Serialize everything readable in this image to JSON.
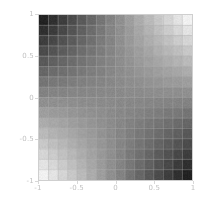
{
  "figure": {
    "type": "density-plot",
    "background_color": "#ffffff",
    "frame_color": "#cfcfcf",
    "grid_color": "#b0b0b0",
    "tick_label_color": "#c2c2c2"
  },
  "chart_data": {
    "type": "heatmap",
    "title": "",
    "subtitle": "",
    "xlabel": "",
    "ylabel": "",
    "xlim": [
      -1,
      1
    ],
    "ylim": [
      -1,
      1
    ],
    "xticks": [
      -1,
      -0.5,
      0,
      0.5,
      1
    ],
    "yticks": [
      -1,
      -0.5,
      0,
      0.5,
      1
    ],
    "xtick_labels": [
      "-1",
      "-0.5",
      "0",
      "0.5",
      "1"
    ],
    "ytick_labels": [
      "-1",
      "-0.5",
      "0",
      "0.5",
      "1"
    ],
    "grid": true,
    "legend": "none",
    "colormap": "grayscale",
    "colormap_min_color": "#141414",
    "colormap_max_color": "#ffffff",
    "nx": 16,
    "ny": 16,
    "value_range": [
      -1,
      1
    ],
    "values": [
      [
        -0.879,
        -0.762,
        -0.645,
        -0.527,
        -0.41,
        -0.293,
        -0.176,
        -0.059,
        0.059,
        0.176,
        0.293,
        0.41,
        0.527,
        0.645,
        0.762,
        0.879
      ],
      [
        -0.762,
        -0.66,
        -0.559,
        -0.457,
        -0.355,
        -0.254,
        -0.152,
        -0.051,
        0.051,
        0.152,
        0.254,
        0.355,
        0.457,
        0.559,
        0.66,
        0.762
      ],
      [
        -0.645,
        -0.559,
        -0.473,
        -0.387,
        -0.301,
        -0.215,
        -0.129,
        -0.043,
        0.043,
        0.129,
        0.215,
        0.301,
        0.387,
        0.473,
        0.559,
        0.645
      ],
      [
        -0.527,
        -0.457,
        -0.387,
        -0.316,
        -0.246,
        -0.176,
        -0.105,
        -0.035,
        0.035,
        0.105,
        0.176,
        0.246,
        0.316,
        0.387,
        0.457,
        0.527
      ],
      [
        -0.41,
        -0.355,
        -0.301,
        -0.246,
        -0.191,
        -0.137,
        -0.082,
        -0.027,
        0.027,
        0.082,
        0.137,
        0.191,
        0.246,
        0.301,
        0.355,
        0.41
      ],
      [
        -0.293,
        -0.254,
        -0.215,
        -0.176,
        -0.137,
        -0.098,
        -0.059,
        -0.02,
        0.02,
        0.059,
        0.098,
        0.137,
        0.176,
        0.215,
        0.254,
        0.293
      ],
      [
        -0.176,
        -0.152,
        -0.129,
        -0.105,
        -0.082,
        -0.059,
        -0.035,
        -0.012,
        0.012,
        0.035,
        0.059,
        0.082,
        0.105,
        0.129,
        0.152,
        0.176
      ],
      [
        -0.059,
        -0.051,
        -0.043,
        -0.035,
        -0.027,
        -0.02,
        -0.012,
        -0.004,
        0.004,
        0.012,
        0.02,
        0.027,
        0.035,
        0.043,
        0.051,
        0.059
      ],
      [
        0.059,
        0.051,
        0.043,
        0.035,
        0.027,
        0.02,
        0.012,
        0.004,
        -0.004,
        -0.012,
        -0.02,
        -0.027,
        -0.035,
        -0.043,
        -0.051,
        -0.059
      ],
      [
        0.176,
        0.152,
        0.129,
        0.105,
        0.082,
        0.059,
        0.035,
        0.012,
        -0.012,
        -0.035,
        -0.059,
        -0.082,
        -0.105,
        -0.129,
        -0.152,
        -0.176
      ],
      [
        0.293,
        0.254,
        0.215,
        0.176,
        0.137,
        0.098,
        0.059,
        0.02,
        -0.02,
        -0.059,
        -0.098,
        -0.137,
        -0.176,
        -0.215,
        -0.254,
        -0.293
      ],
      [
        0.41,
        0.355,
        0.301,
        0.246,
        0.191,
        0.137,
        0.082,
        0.027,
        -0.027,
        -0.082,
        -0.137,
        -0.191,
        -0.246,
        -0.301,
        -0.355,
        -0.41
      ],
      [
        0.527,
        0.457,
        0.387,
        0.316,
        0.246,
        0.176,
        0.105,
        0.035,
        -0.035,
        -0.105,
        -0.176,
        -0.246,
        -0.316,
        -0.387,
        -0.457,
        -0.527
      ],
      [
        0.645,
        0.559,
        0.473,
        0.387,
        0.301,
        0.215,
        0.129,
        0.043,
        -0.043,
        -0.129,
        -0.215,
        -0.301,
        -0.387,
        -0.473,
        -0.559,
        -0.645
      ],
      [
        0.762,
        0.66,
        0.559,
        0.457,
        0.355,
        0.254,
        0.152,
        0.051,
        -0.051,
        -0.152,
        -0.254,
        -0.355,
        -0.457,
        -0.559,
        -0.66,
        -0.762
      ],
      [
        0.879,
        0.762,
        0.645,
        0.527,
        0.41,
        0.293,
        0.176,
        0.059,
        -0.059,
        -0.176,
        -0.293,
        -0.41,
        -0.527,
        -0.645,
        -0.762,
        -0.879
      ]
    ]
  }
}
